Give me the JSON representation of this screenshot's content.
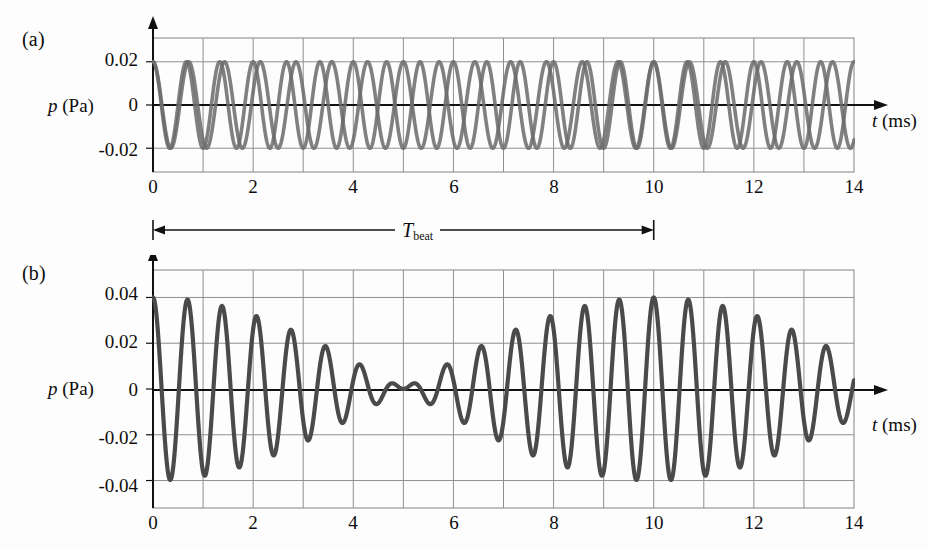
{
  "figure": {
    "background": "#fdfdfd",
    "ink": "#0d0d0d",
    "grid_color": "#8f8f8f",
    "curve_color": "#6b6b6b",
    "axis_color": "#111111"
  },
  "panels": [
    {
      "key": "a",
      "letter": "(a)",
      "y_axis_label_italic": "p",
      "y_axis_label_unit": "(Pa)",
      "x_axis_label_italic": "t",
      "x_axis_label_unit": "(ms)",
      "x_ticks": [
        "0",
        "2",
        "4",
        "6",
        "8",
        "10",
        "12",
        "14"
      ],
      "y_ticks": [
        "0.02",
        "0",
        "-0.02"
      ]
    },
    {
      "key": "b",
      "letter": "(b)",
      "y_axis_label_italic": "p",
      "y_axis_label_unit": "(Pa)",
      "x_axis_label_italic": "t",
      "x_axis_label_unit": "(ms)",
      "x_ticks": [
        "0",
        "2",
        "4",
        "6",
        "8",
        "10",
        "12",
        "14"
      ],
      "y_ticks": [
        "0.04",
        "0.02",
        "0",
        "-0.02",
        "-0.04"
      ]
    }
  ],
  "annotation": {
    "label_base": "T",
    "label_sub": "beat",
    "start_ms": 0,
    "end_ms": 10
  },
  "chart_data": [
    {
      "type": "line",
      "panel": "a",
      "title": "",
      "xlabel": "t (ms)",
      "ylabel": "p (Pa)",
      "xlim": [
        0,
        14
      ],
      "ylim": [
        -0.031,
        0.031
      ],
      "xticks": [
        0,
        2,
        4,
        6,
        8,
        10,
        12,
        14
      ],
      "yticks": [
        0.02,
        0,
        -0.02
      ],
      "grid": true,
      "legend": "none",
      "series": [
        {
          "name": "wave-1",
          "waveform": "cosine",
          "amplitude": 0.02,
          "frequency_khz": 1.5,
          "phase_deg": 0,
          "color": "#6b6b6b"
        },
        {
          "name": "wave-2",
          "waveform": "cosine",
          "amplitude": 0.02,
          "frequency_khz": 1.4,
          "phase_deg": 0,
          "color": "#6b6b6b"
        }
      ]
    },
    {
      "type": "line",
      "panel": "b",
      "title": "",
      "xlabel": "t (ms)",
      "ylabel": "p (Pa)",
      "xlim": [
        0,
        14
      ],
      "ylim": [
        -0.052,
        0.052
      ],
      "xticks": [
        0,
        2,
        4,
        6,
        8,
        10,
        12,
        14
      ],
      "yticks": [
        0.04,
        0.02,
        0,
        -0.02,
        -0.04
      ],
      "grid": true,
      "legend": "none",
      "series": [
        {
          "name": "superposition",
          "waveform": "sum-of-cosines",
          "amplitude": 0.02,
          "frequency_khz": [
            1.5,
            1.4
          ],
          "envelope_peak": 0.04,
          "beat_period_ms": 10,
          "node_time_ms": 5,
          "color": "#4a4a4a"
        }
      ]
    }
  ]
}
